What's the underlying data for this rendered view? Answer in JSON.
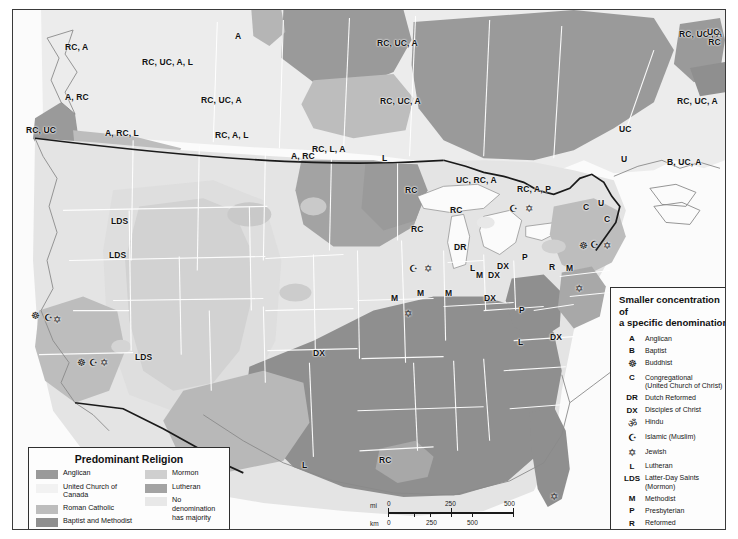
{
  "map": {
    "title_internal": "Predominant Religion in North America",
    "colors": {
      "anglican": "#9a9a9a",
      "united_church_canada": "#ececec",
      "roman_catholic": "#bdbdbd",
      "baptist_methodist": "#8f8f8f",
      "mormon": "#c9c9c9",
      "lutheran": "#a3a3a3",
      "no_majority": "#e4e4e4",
      "water": "#fbfbfb",
      "state_border": "#ffffff",
      "country_border": "#1a1a1a",
      "coast": "#8a8a8a",
      "frame": "#3a3a3a"
    },
    "labels": [
      {
        "text": "RC, A",
        "x": 64,
        "y": 42
      },
      {
        "text": "A",
        "x": 234,
        "y": 31
      },
      {
        "text": "RC, UC, A, L",
        "x": 141,
        "y": 57
      },
      {
        "text": "RC, UC, A",
        "x": 376,
        "y": 38
      },
      {
        "text": "RC, UC , A",
        "x": 678,
        "y": 29
      },
      {
        "text": "A, RC",
        "x": 64,
        "y": 92
      },
      {
        "text": "RC, UC, A",
        "x": 200,
        "y": 95
      },
      {
        "text": "RC, UC, A",
        "x": 379,
        "y": 96
      },
      {
        "text": "RC, UC, A",
        "x": 676,
        "y": 96
      },
      {
        "text": "RC, UC",
        "x": 25,
        "y": 125
      },
      {
        "text": "A, RC, L",
        "x": 104,
        "y": 128
      },
      {
        "text": "RC, A, L",
        "x": 214,
        "y": 130
      },
      {
        "text": "UC",
        "x": 618,
        "y": 124
      },
      {
        "text": "UC,\nRC",
        "x": 706,
        "y": 27
      },
      {
        "text": "A, RC",
        "x": 290,
        "y": 151
      },
      {
        "text": "RC, L, A",
        "x": 311,
        "y": 144
      },
      {
        "text": "L",
        "x": 381,
        "y": 153
      },
      {
        "text": "U",
        "x": 620,
        "y": 154
      },
      {
        "text": "B, UC, A",
        "x": 666,
        "y": 157
      },
      {
        "text": "RC",
        "x": 404,
        "y": 185
      },
      {
        "text": "UC, RC, A",
        "x": 455,
        "y": 175
      },
      {
        "text": "RC, A, P",
        "x": 516,
        "y": 184
      },
      {
        "text": "C",
        "x": 582,
        "y": 202
      },
      {
        "text": "U",
        "x": 597,
        "y": 198
      },
      {
        "text": "RC",
        "x": 410,
        "y": 224
      },
      {
        "text": "RC",
        "x": 449,
        "y": 205
      },
      {
        "text": "C",
        "x": 603,
        "y": 214
      },
      {
        "text": "LDS",
        "x": 110,
        "y": 216
      },
      {
        "text": "LDS",
        "x": 108,
        "y": 250
      },
      {
        "text": "DR",
        "x": 453,
        "y": 242
      },
      {
        "text": "L",
        "x": 469,
        "y": 263
      },
      {
        "text": "DX",
        "x": 496,
        "y": 261
      },
      {
        "text": "P",
        "x": 521,
        "y": 252
      },
      {
        "text": "R",
        "x": 548,
        "y": 262
      },
      {
        "text": "M",
        "x": 565,
        "y": 263
      },
      {
        "text": "M",
        "x": 390,
        "y": 293
      },
      {
        "text": "M",
        "x": 416,
        "y": 288
      },
      {
        "text": "M",
        "x": 444,
        "y": 288
      },
      {
        "text": "M",
        "x": 475,
        "y": 270
      },
      {
        "text": "DX",
        "x": 483,
        "y": 293
      },
      {
        "text": "DX",
        "x": 487,
        "y": 270
      },
      {
        "text": "P",
        "x": 518,
        "y": 305
      },
      {
        "text": "L",
        "x": 517,
        "y": 337
      },
      {
        "text": "DX",
        "x": 549,
        "y": 332
      },
      {
        "text": "LDS",
        "x": 134,
        "y": 352
      },
      {
        "text": "DX",
        "x": 312,
        "y": 348
      },
      {
        "text": "RC",
        "x": 378,
        "y": 455
      },
      {
        "text": "L",
        "x": 301,
        "y": 460
      }
    ],
    "symbols": [
      {
        "glyph": "☸",
        "x": 30,
        "y": 310
      },
      {
        "glyph": "☪",
        "x": 43,
        "y": 312
      },
      {
        "glyph": "✡",
        "x": 52,
        "y": 314
      },
      {
        "glyph": "☸",
        "x": 76,
        "y": 357
      },
      {
        "glyph": "☪",
        "x": 88,
        "y": 357
      },
      {
        "glyph": "✡",
        "x": 99,
        "y": 357
      },
      {
        "glyph": "☪",
        "x": 408,
        "y": 263
      },
      {
        "glyph": "✡",
        "x": 423,
        "y": 263
      },
      {
        "glyph": "☪",
        "x": 508,
        "y": 203
      },
      {
        "glyph": "✡",
        "x": 524,
        "y": 203
      },
      {
        "glyph": "☸",
        "x": 578,
        "y": 240
      },
      {
        "glyph": "☪",
        "x": 589,
        "y": 239
      },
      {
        "glyph": "✡",
        "x": 602,
        "y": 240
      },
      {
        "glyph": "✡",
        "x": 574,
        "y": 283
      },
      {
        "glyph": "✡",
        "x": 403,
        "y": 308
      },
      {
        "glyph": "✡",
        "x": 549,
        "y": 491
      }
    ]
  },
  "legend_predominant": {
    "title": "Predominant Religion",
    "column1": [
      {
        "label": "Anglican",
        "color": "#9a9a9a"
      },
      {
        "label": "United Church of Canada",
        "color": "#f2f2f2"
      },
      {
        "label": "Roman Catholic",
        "color": "#bdbdbd"
      },
      {
        "label": "Baptist and Methodist",
        "color": "#8f8f8f"
      }
    ],
    "column2": [
      {
        "label": "Mormon",
        "color": "#cfcfcf"
      },
      {
        "label": "Lutheran",
        "color": "#a3a3a3"
      },
      {
        "label": "No denomination\nhas majority",
        "color": "#e8e8e8"
      }
    ]
  },
  "legend_denominations": {
    "title": "Smaller concentration of\na specific denomination",
    "items": [
      {
        "key": "A",
        "name": "Anglican",
        "icon": false
      },
      {
        "key": "B",
        "name": "Baptist",
        "icon": false
      },
      {
        "key": "☸",
        "name": "Buddhist",
        "icon": true
      },
      {
        "key": "C",
        "name": "Congregational\n(United Church of Christ)",
        "icon": false
      },
      {
        "key": "DR",
        "name": "Dutch Reformed",
        "icon": false
      },
      {
        "key": "DX",
        "name": "Disciples of Christ",
        "icon": false
      },
      {
        "key": "ॐ",
        "name": "Hindu",
        "icon": true
      },
      {
        "key": "☪",
        "name": "Islamic (Muslim)",
        "icon": true
      },
      {
        "key": "✡",
        "name": "Jewish",
        "icon": true
      },
      {
        "key": "L",
        "name": "Lutheran",
        "icon": false
      },
      {
        "key": "LDS",
        "name": "Latter-Day Saints (Mormon)",
        "icon": false
      },
      {
        "key": "M",
        "name": "Methodist",
        "icon": false
      },
      {
        "key": "P",
        "name": "Presbyterian",
        "icon": false
      },
      {
        "key": "R",
        "name": "Reformed",
        "icon": false
      },
      {
        "key": "RC",
        "name": "Roman Catholic",
        "icon": false
      },
      {
        "key": "U",
        "name": "Unitarian",
        "icon": false
      },
      {
        "key": "UC",
        "name": "United Church of Canada",
        "icon": false
      }
    ]
  },
  "scale_bar": {
    "mi_unit": "mi",
    "km_unit": "km",
    "mi_ticks": [
      "0",
      "250",
      "500"
    ],
    "km_ticks": [
      "0",
      "250",
      "500"
    ]
  }
}
